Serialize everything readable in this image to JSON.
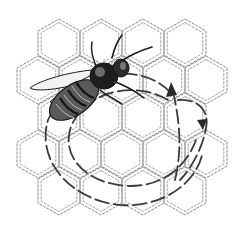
{
  "figure": {
    "alt": "Line-art illustration of a honeybee on honeycomb cells with dashed arrows tracing a waggle-dance path",
    "subject": "honeybee",
    "background": "honeycomb",
    "overlay": "waggle-dance-arrows",
    "colors": {
      "background": "#ffffff",
      "comb_line": "#8a8a8a",
      "bee_ink": "#1a1a1a",
      "arrow": "#3a3a3a"
    }
  }
}
